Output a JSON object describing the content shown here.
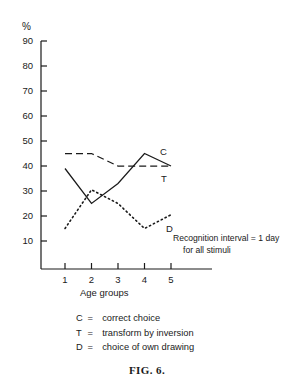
{
  "chart_data": {
    "type": "line",
    "title": "",
    "xlabel": "Age groups",
    "ylabel": "%",
    "categories": [
      "1",
      "2",
      "3",
      "4",
      "5"
    ],
    "x": [
      1,
      2,
      3,
      4,
      5
    ],
    "xlim": [
      0.5,
      5.8
    ],
    "ylim": [
      0,
      95
    ],
    "ytick_labels": [
      "90",
      "80",
      "70",
      "60",
      "50",
      "40",
      "30",
      "20",
      "10"
    ],
    "yticks": [
      90,
      80,
      70,
      60,
      50,
      40,
      30,
      20,
      10
    ],
    "grid": false,
    "legend_position": "below-plot",
    "series": [
      {
        "name": "C",
        "label": "C",
        "style": "solid",
        "values": [
          39,
          25,
          33,
          45,
          40
        ]
      },
      {
        "name": "T",
        "label": "T",
        "style": "dashed",
        "values": [
          45,
          45,
          40,
          40,
          40
        ]
      },
      {
        "name": "D",
        "label": "D",
        "style": "dotted",
        "values": [
          15,
          30.5,
          25,
          15,
          20.5
        ]
      }
    ],
    "annotations": [
      "Recognition interval = 1 day",
      "for all stimuli"
    ]
  },
  "axis": {
    "y_unit_label": "%",
    "x_axis_title": "Age groups"
  },
  "series_tags": {
    "c": "C",
    "t": "T",
    "d": "D"
  },
  "annotation": {
    "line1": "Recognition interval = 1 day",
    "line2": "for all stimuli"
  },
  "legend": {
    "rows": [
      {
        "key": "C",
        "eq": "=",
        "desc": "correct choice"
      },
      {
        "key": "T",
        "eq": "=",
        "desc": "transform by inversion"
      },
      {
        "key": "D",
        "eq": "=",
        "desc": "choice of own drawing"
      }
    ]
  },
  "caption": {
    "text": "FIG. 6."
  },
  "colors": {
    "ink": "#1a1a1a",
    "background": "#ffffff"
  }
}
